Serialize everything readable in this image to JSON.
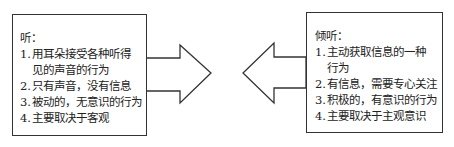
{
  "left_panel": {
    "title": "听：",
    "items": [
      {
        "num": "1.",
        "text": "用耳朵接受各种听得",
        "cont": "见的声音的行为"
      },
      {
        "num": "2.",
        "text": "只有声音，没有信息"
      },
      {
        "num": "3.",
        "text": "被动的，无意识的行为"
      },
      {
        "num": "4.",
        "text": "主要取决于客观"
      }
    ]
  },
  "right_panel": {
    "title": "倾听：",
    "items": [
      {
        "num": "1.",
        "text": "主动获取信息的一种",
        "cont": "行为"
      },
      {
        "num": "2.",
        "text": "有信息，需要专心关注"
      },
      {
        "num": "3.",
        "text": "积极的，有意识的行为"
      },
      {
        "num": "4.",
        "text": "主要取决于主观意识"
      }
    ]
  },
  "arrows": {
    "left": "right-pointing",
    "right": "left-pointing",
    "stroke_color": "#333333"
  }
}
